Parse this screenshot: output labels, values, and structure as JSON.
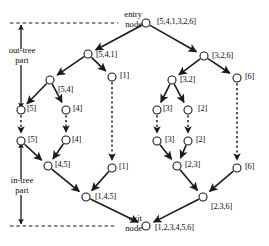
{
  "figure": {
    "kind": "directed-graph-diagram",
    "background_color": "#ffffff",
    "stroke_color": "#1a1a1a",
    "width": 269,
    "height": 246
  },
  "annotations": {
    "entry_node": "entry\nnode",
    "entry_node_line1": "entry",
    "entry_node_line2": "node",
    "exit_node_line1": "exit",
    "exit_node_line2": "node",
    "out_tree_line1": "out-tree",
    "out_tree_line2": "part",
    "in_tree_line1": "in-tree",
    "in_tree_line2": "part"
  },
  "nodes": [
    {
      "id": "entry",
      "label": "[5,4,1,3,2,6]",
      "cx": 146,
      "cy": 23,
      "r": 4.0,
      "label_x": 157,
      "label_y": 18
    },
    {
      "id": "n_541",
      "label": "[5,4,1]",
      "cx": 88,
      "cy": 54,
      "r": 4.0,
      "label_x": 96,
      "label_y": 51
    },
    {
      "id": "n_326",
      "label": "[3,2,6]",
      "cx": 204,
      "cy": 56,
      "r": 4.0,
      "label_x": 212,
      "label_y": 52
    },
    {
      "id": "n_54",
      "label": "[5,4]",
      "cx": 50,
      "cy": 80,
      "r": 4.0,
      "label_x": 58,
      "label_y": 86
    },
    {
      "id": "n_1_top",
      "label": "[1]",
      "cx": 112,
      "cy": 77,
      "r": 4.0,
      "label_x": 120,
      "label_y": 72
    },
    {
      "id": "n_32",
      "label": "[3,2]",
      "cx": 172,
      "cy": 80,
      "r": 4.0,
      "label_x": 180,
      "label_y": 76
    },
    {
      "id": "n_6_top",
      "label": "[6]",
      "cx": 237,
      "cy": 78,
      "r": 4.0,
      "label_x": 245,
      "label_y": 73
    },
    {
      "id": "n_5_out",
      "label": "[5]",
      "cx": 21,
      "cy": 110,
      "r": 4.0,
      "label_x": 27,
      "label_y": 105
    },
    {
      "id": "n_4_out",
      "label": "[4]",
      "cx": 66,
      "cy": 110,
      "r": 4.0,
      "label_x": 73,
      "label_y": 105
    },
    {
      "id": "n_3_out",
      "label": "[3]",
      "cx": 157,
      "cy": 110,
      "r": 4.0,
      "label_x": 163,
      "label_y": 105
    },
    {
      "id": "n_2_out",
      "label": "[2]",
      "cx": 188,
      "cy": 110,
      "r": 4.0,
      "label_x": 198,
      "label_y": 105
    },
    {
      "id": "n_5_in",
      "label": "[5]",
      "cx": 21,
      "cy": 141,
      "r": 4.0,
      "label_x": 28,
      "label_y": 136
    },
    {
      "id": "n_4_in",
      "label": "[4]",
      "cx": 66,
      "cy": 140,
      "r": 4.0,
      "label_x": 72,
      "label_y": 136
    },
    {
      "id": "n_3_in",
      "label": "[3]",
      "cx": 157,
      "cy": 141,
      "r": 4.0,
      "label_x": 165,
      "label_y": 136
    },
    {
      "id": "n_2_in",
      "label": "[2]",
      "cx": 188,
      "cy": 141,
      "r": 4.0,
      "label_x": 196,
      "label_y": 136
    },
    {
      "id": "n_45",
      "label": "[4,5]",
      "cx": 48,
      "cy": 166,
      "r": 4.0,
      "label_x": 55,
      "label_y": 161
    },
    {
      "id": "n_23",
      "label": "[2,3]",
      "cx": 177,
      "cy": 166,
      "r": 4.0,
      "label_x": 185,
      "label_y": 161
    },
    {
      "id": "n_1_bot",
      "label": "[1]",
      "cx": 112,
      "cy": 168,
      "r": 4.0,
      "label_x": 119,
      "label_y": 163
    },
    {
      "id": "n_6_bot",
      "label": "[6]",
      "cx": 237,
      "cy": 168,
      "r": 4.0,
      "label_x": 245,
      "label_y": 163
    },
    {
      "id": "n_145",
      "label": "[1,4,5]",
      "cx": 86,
      "cy": 197,
      "r": 4.0,
      "label_x": 95,
      "label_y": 193
    },
    {
      "id": "n_236",
      "label": "[2,3,6]",
      "cx": 203,
      "cy": 197,
      "r": 4.0,
      "label_x": 211,
      "label_y": 203
    },
    {
      "id": "exit",
      "label": "[1,2,3,4,5,6]",
      "cx": 146,
      "cy": 226,
      "r": 4.0,
      "label_x": 155,
      "label_y": 224
    }
  ],
  "edges_solid": [
    {
      "from": "entry",
      "to": "n_541"
    },
    {
      "from": "entry",
      "to": "n_326"
    },
    {
      "from": "n_541",
      "to": "n_54"
    },
    {
      "from": "n_541",
      "to": "n_1_top"
    },
    {
      "from": "n_326",
      "to": "n_32"
    },
    {
      "from": "n_326",
      "to": "n_6_top"
    },
    {
      "from": "n_54",
      "to": "n_5_out"
    },
    {
      "from": "n_54",
      "to": "n_4_out"
    },
    {
      "from": "n_32",
      "to": "n_3_out"
    },
    {
      "from": "n_32",
      "to": "n_2_out"
    },
    {
      "from": "n_5_in",
      "to": "n_45"
    },
    {
      "from": "n_4_in",
      "to": "n_45"
    },
    {
      "from": "n_3_in",
      "to": "n_23"
    },
    {
      "from": "n_2_in",
      "to": "n_23"
    },
    {
      "from": "n_45",
      "to": "n_145"
    },
    {
      "from": "n_1_bot",
      "to": "n_145"
    },
    {
      "from": "n_23",
      "to": "n_236"
    },
    {
      "from": "n_6_bot",
      "to": "n_236"
    },
    {
      "from": "n_145",
      "to": "exit"
    },
    {
      "from": "n_236",
      "to": "exit"
    }
  ],
  "edges_dashed": [
    {
      "from": "n_5_out",
      "to": "n_5_in"
    },
    {
      "from": "n_4_out",
      "to": "n_4_in"
    },
    {
      "from": "n_3_out",
      "to": "n_3_in"
    },
    {
      "from": "n_2_out",
      "to": "n_2_in"
    },
    {
      "from": "n_1_top",
      "to": "n_1_bot"
    },
    {
      "from": "n_6_top",
      "to": "n_6_bot"
    }
  ],
  "brackets": {
    "out_tree": {
      "x": 21,
      "y_top": 25,
      "y_bottom": 108,
      "label_x": 21,
      "label_y": 55
    },
    "in_tree": {
      "x": 21,
      "y_top": 143,
      "y_bottom": 224,
      "label_x": 21,
      "label_y": 185
    }
  },
  "guides": [
    {
      "name": "entry-guide-line",
      "x1": 10,
      "y1": 23,
      "x2": 118,
      "y2": 23
    },
    {
      "name": "exit-guide-line",
      "x1": 10,
      "y1": 226,
      "x2": 116,
      "y2": 226
    }
  ]
}
